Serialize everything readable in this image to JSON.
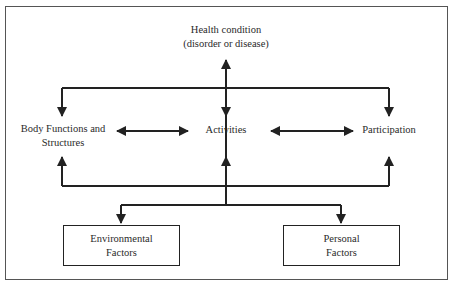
{
  "diagram": {
    "title_node": {
      "line1": "Health condition",
      "line2": "(disorder or disease)"
    },
    "middle_nodes": {
      "body": {
        "line1": "Body Functions and",
        "line2": "Structures"
      },
      "activities": {
        "label": "Activities"
      },
      "participation": {
        "label": "Participation"
      }
    },
    "bottom_nodes": {
      "environmental": {
        "line1": "Environmental",
        "line2": "Factors"
      },
      "personal": {
        "line1": "Personal",
        "line2": "Factors"
      }
    },
    "colors": {
      "line": "#222222",
      "frame": "#555555",
      "background": "#ffffff"
    }
  }
}
